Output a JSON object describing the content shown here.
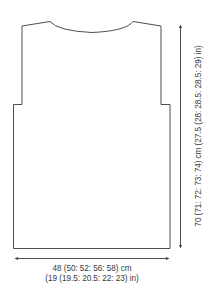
{
  "diagram": {
    "stroke_color": "#3a3a3a",
    "text_color": "#3a3a3a",
    "background": "#ffffff"
  },
  "measurements": {
    "width": {
      "cm": "48 (50: 52: 56: 58) cm",
      "in": "(19 (19.5: 20.5: 22: 23) in)"
    },
    "length": {
      "label": "70 (71: 72: 73: 74) cm (27.5 (28: 28.5: 28.5: 29) in)"
    }
  }
}
